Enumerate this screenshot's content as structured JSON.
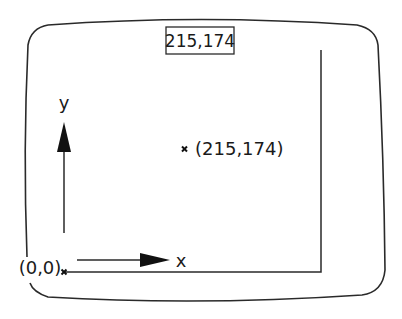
{
  "diagram": {
    "kind": "screen-coordinate-system",
    "readout_box": {
      "label": "215,174"
    },
    "point": {
      "label": "(215,174)",
      "x": 215,
      "y": 174
    },
    "origin": {
      "label": "(0,0)"
    },
    "axes": {
      "x_label": "x",
      "y_label": "y"
    },
    "colors": {
      "stroke": "#2a2a2a",
      "background": "#ffffff"
    }
  }
}
